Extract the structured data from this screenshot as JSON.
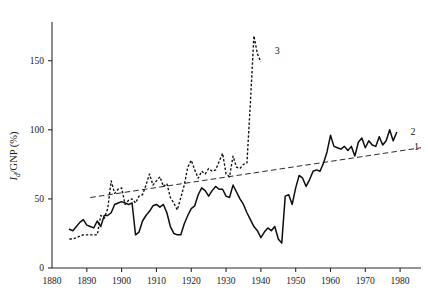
{
  "chart_data": {
    "type": "line",
    "title": "",
    "xlabel": "",
    "ylabel": "I_d/GNP (%)",
    "ylabel_main": "/GNP (%)",
    "ylabel_italic": "I",
    "ylabel_sub": "d",
    "xlim": [
      1880,
      1986
    ],
    "ylim": [
      0,
      178
    ],
    "grid": false,
    "legend_position": "inline-right",
    "x_ticks": [
      1880,
      1890,
      1900,
      1910,
      1920,
      1930,
      1940,
      1950,
      1960,
      1970,
      1980
    ],
    "y_ticks": [
      0,
      50,
      100,
      150
    ],
    "annotations": [
      {
        "label": "1",
        "x": 1984,
        "y": 88,
        "series": "trend-line"
      },
      {
        "label": "2",
        "x": 1983,
        "y": 99,
        "series": "solid-curve"
      },
      {
        "label": "3",
        "x": 1944,
        "y": 157,
        "series": "dashed-curve"
      }
    ],
    "series": [
      {
        "name": "1",
        "style": "long-dashed",
        "description": "trend line",
        "x": [
          1891,
          1986
        ],
        "values": [
          51,
          87
        ]
      },
      {
        "name": "2",
        "style": "solid",
        "description": "solid curve",
        "x": [
          1885,
          1886,
          1887,
          1888,
          1889,
          1890,
          1891,
          1892,
          1893,
          1894,
          1895,
          1896,
          1897,
          1898,
          1899,
          1900,
          1901,
          1902,
          1903,
          1904,
          1905,
          1906,
          1907,
          1908,
          1909,
          1910,
          1911,
          1912,
          1913,
          1914,
          1915,
          1916,
          1917,
          1918,
          1919,
          1920,
          1921,
          1922,
          1923,
          1924,
          1925,
          1926,
          1927,
          1928,
          1929,
          1930,
          1931,
          1932,
          1933,
          1934,
          1935,
          1936,
          1937,
          1938,
          1939,
          1940,
          1941,
          1942,
          1943,
          1944,
          1945,
          1946,
          1947,
          1948,
          1949,
          1950,
          1951,
          1952,
          1953,
          1954,
          1955,
          1956,
          1957,
          1958,
          1959,
          1960,
          1961,
          1962,
          1963,
          1964,
          1965,
          1966,
          1967,
          1968,
          1969,
          1970,
          1971,
          1972,
          1973,
          1974,
          1975,
          1976,
          1977,
          1978,
          1979
        ],
        "values": [
          28,
          27,
          30,
          33,
          35,
          31,
          30,
          29,
          34,
          30,
          38,
          38,
          40,
          46,
          47,
          48,
          47,
          46,
          47,
          24,
          26,
          34,
          38,
          41,
          45,
          46,
          44,
          46,
          40,
          30,
          25,
          24,
          24,
          32,
          38,
          43,
          45,
          53,
          58,
          56,
          52,
          56,
          59,
          57,
          57,
          52,
          51,
          60,
          55,
          50,
          46,
          40,
          35,
          30,
          27,
          22,
          26,
          29,
          27,
          30,
          21,
          18,
          52,
          53,
          46,
          58,
          67,
          65,
          59,
          64,
          70,
          71,
          70,
          76,
          84,
          96,
          88,
          87,
          86,
          88,
          85,
          88,
          81,
          91,
          94,
          87,
          92,
          89,
          88,
          95,
          89,
          92,
          100,
          92,
          98
        ]
      },
      {
        "name": "3",
        "style": "short-dashed",
        "description": "dashed curve with spike",
        "x": [
          1885,
          1886,
          1887,
          1888,
          1889,
          1890,
          1891,
          1892,
          1893,
          1894,
          1895,
          1896,
          1897,
          1898,
          1899,
          1900,
          1901,
          1902,
          1903,
          1904,
          1905,
          1906,
          1907,
          1908,
          1909,
          1910,
          1911,
          1912,
          1913,
          1914,
          1915,
          1916,
          1917,
          1918,
          1919,
          1920,
          1921,
          1922,
          1923,
          1924,
          1925,
          1926,
          1927,
          1928,
          1929,
          1930,
          1931,
          1932,
          1933,
          1934,
          1935,
          1936,
          1937,
          1938,
          1939,
          1940
        ],
        "values": [
          21,
          21,
          22,
          23,
          24,
          24,
          24,
          24,
          24,
          38,
          36,
          43,
          63,
          54,
          57,
          58,
          46,
          49,
          50,
          47,
          52,
          53,
          60,
          68,
          60,
          63,
          66,
          59,
          61,
          51,
          47,
          42,
          51,
          60,
          73,
          78,
          71,
          65,
          70,
          68,
          72,
          70,
          71,
          77,
          83,
          68,
          66,
          81,
          73,
          72,
          75,
          76,
          120,
          168,
          155,
          149
        ]
      }
    ]
  }
}
